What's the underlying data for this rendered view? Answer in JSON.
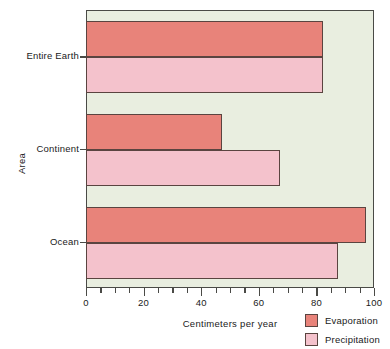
{
  "chart_data": {
    "type": "bar",
    "orientation": "horizontal",
    "title": "",
    "xlabel": "Centimeters per year",
    "ylabel": "Area",
    "categories": [
      "Entire Earth",
      "Continent",
      "Ocean"
    ],
    "series": [
      {
        "name": "Evaporation",
        "color": "#e8837a",
        "values": [
          82,
          47,
          97
        ]
      },
      {
        "name": "Precipitation",
        "color": "#f4c2cc",
        "values": [
          82,
          67,
          87
        ]
      }
    ],
    "xlim": [
      0,
      100
    ],
    "xticks": [
      0,
      20,
      40,
      60,
      80,
      100
    ],
    "xtick_labels": [
      "0",
      "20",
      "40",
      "60",
      "80",
      "100"
    ],
    "xminor_tick_step": 5,
    "grid": false,
    "legend_position": "bottom-right",
    "plot_background": "#e9eee0",
    "axis_color": "#4a4a46",
    "bar_outline_color": "#5a4440"
  },
  "legend": {
    "entries": [
      {
        "label": "Evaporation"
      },
      {
        "label": "Precipitation"
      }
    ]
  }
}
